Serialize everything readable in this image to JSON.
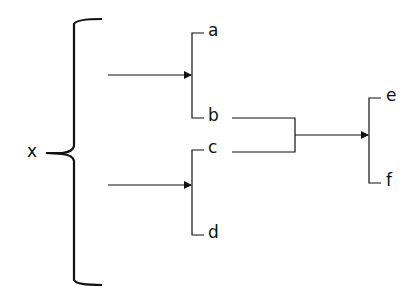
{
  "diagram": {
    "root_label": "x",
    "group1": {
      "top": "a",
      "bottom": "b"
    },
    "group2": {
      "top": "c",
      "bottom": "d"
    },
    "result": {
      "top": "e",
      "bottom": "f"
    },
    "line_color": "#111111"
  }
}
